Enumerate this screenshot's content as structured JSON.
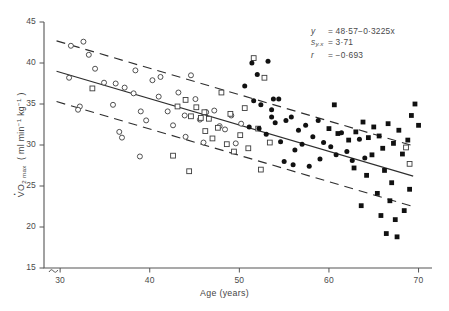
{
  "chart_data": {
    "type": "scatter",
    "title": "",
    "xlabel": "Age (years)",
    "ylabel_plain": "VO2max (ml min-1 kg-1)",
    "xlim": [
      28.2,
      71.5
    ],
    "ylim": [
      15,
      45
    ],
    "xticks": [
      30,
      40,
      50,
      60,
      70
    ],
    "yticks": [
      45,
      40,
      35,
      30,
      25,
      20,
      15
    ],
    "grid": false,
    "legend": "none",
    "axis_break": true,
    "annotations": {
      "regression_equation": "y  = 48·57−0·3225x",
      "standard_error": "sᵧ.ₓ = 3·71",
      "correlation": "r  = −0·693",
      "symbol_y": "y",
      "symbol_s": "s",
      "symbol_r": "r",
      "value_y": "= 48·57−0·3225x",
      "value_s": "= 3·71",
      "value_r": "= −0·693"
    },
    "fit": {
      "intercept": 48.57,
      "slope": -0.3225,
      "sy_x": 3.71,
      "r": -0.693
    },
    "lines": [
      {
        "name": "regression-line",
        "style": "solid",
        "x": [
          29.6,
          69.4
        ],
        "y": [
          39.0,
          26.2
        ]
      },
      {
        "name": "upper-confidence-band",
        "style": "dashed",
        "x": [
          29.6,
          69.4
        ],
        "y": [
          42.7,
          29.9
        ]
      },
      {
        "name": "lower-confidence-band",
        "style": "dashed",
        "x": [
          29.6,
          69.4
        ],
        "y": [
          35.3,
          22.5
        ]
      }
    ],
    "series": [
      {
        "name": "open-circle",
        "marker": "open-circle",
        "points": [
          [
            31.2,
            42.1
          ],
          [
            32.6,
            42.6
          ],
          [
            33.2,
            41.0
          ],
          [
            31.0,
            38.2
          ],
          [
            33.9,
            39.3
          ],
          [
            34.9,
            37.6
          ],
          [
            36.2,
            37.5
          ],
          [
            35.9,
            34.9
          ],
          [
            32.2,
            34.7
          ],
          [
            32.0,
            34.3
          ],
          [
            37.2,
            37.0
          ],
          [
            38.2,
            36.3
          ],
          [
            38.4,
            39.1
          ],
          [
            39.0,
            34.1
          ],
          [
            40.3,
            37.9
          ],
          [
            39.6,
            33.0
          ],
          [
            41.0,
            35.9
          ],
          [
            41.2,
            38.3
          ],
          [
            42.0,
            34.1
          ],
          [
            42.6,
            32.4
          ],
          [
            43.2,
            36.4
          ],
          [
            43.9,
            33.6
          ],
          [
            44.6,
            38.5
          ],
          [
            45.1,
            35.6
          ],
          [
            45.6,
            33.1
          ],
          [
            46.3,
            34.0
          ],
          [
            46.0,
            30.3
          ],
          [
            47.2,
            34.2
          ],
          [
            47.8,
            32.3
          ],
          [
            48.4,
            31.9
          ],
          [
            36.6,
            31.6
          ],
          [
            36.9,
            30.9
          ],
          [
            44.0,
            31.0
          ],
          [
            49.1,
            33.6
          ],
          [
            49.6,
            30.2
          ],
          [
            38.9,
            28.6
          ],
          [
            50.2,
            32.6
          ]
        ]
      },
      {
        "name": "open-square",
        "marker": "open-square",
        "points": [
          [
            33.6,
            36.9
          ],
          [
            43.1,
            34.7
          ],
          [
            44.0,
            35.5
          ],
          [
            44.6,
            33.5
          ],
          [
            45.2,
            34.6
          ],
          [
            45.7,
            33.3
          ],
          [
            46.1,
            34.0
          ],
          [
            46.6,
            33.2
          ],
          [
            46.2,
            31.7
          ],
          [
            47.0,
            30.8
          ],
          [
            47.6,
            32.1
          ],
          [
            48.0,
            36.4
          ],
          [
            48.6,
            30.1
          ],
          [
            49.0,
            33.8
          ],
          [
            49.4,
            29.2
          ],
          [
            50.1,
            31.2
          ],
          [
            50.6,
            34.5
          ],
          [
            51.0,
            29.6
          ],
          [
            51.6,
            40.6
          ],
          [
            52.1,
            32.0
          ],
          [
            52.4,
            27.0
          ],
          [
            42.6,
            28.7
          ],
          [
            44.4,
            26.8
          ],
          [
            52.8,
            38.2
          ],
          [
            53.4,
            30.3
          ],
          [
            68.6,
            29.7
          ],
          [
            69.0,
            27.7
          ]
        ]
      },
      {
        "name": "filled-circle",
        "marker": "filled-circle",
        "points": [
          [
            51.4,
            40.0
          ],
          [
            52.0,
            38.6
          ],
          [
            53.2,
            40.2
          ],
          [
            50.6,
            37.2
          ],
          [
            51.6,
            35.4
          ],
          [
            52.4,
            34.9
          ],
          [
            53.8,
            35.6
          ],
          [
            53.6,
            34.3
          ],
          [
            53.6,
            33.4
          ],
          [
            54.4,
            35.6
          ],
          [
            54.0,
            32.7
          ],
          [
            55.2,
            33.0
          ],
          [
            51.1,
            32.2
          ],
          [
            52.2,
            32.0
          ],
          [
            53.0,
            31.3
          ],
          [
            54.6,
            30.4
          ],
          [
            55.8,
            33.4
          ],
          [
            56.6,
            31.8
          ],
          [
            56.2,
            29.4
          ],
          [
            57.4,
            32.4
          ],
          [
            57.0,
            30.1
          ],
          [
            58.2,
            31.0
          ],
          [
            58.8,
            33.0
          ],
          [
            59.4,
            30.3
          ],
          [
            59.0,
            28.3
          ],
          [
            60.2,
            29.8
          ],
          [
            60.8,
            28.8
          ],
          [
            61.4,
            31.5
          ],
          [
            62.0,
            29.2
          ],
          [
            62.6,
            28.1
          ],
          [
            55.0,
            28.0
          ],
          [
            56.0,
            27.6
          ],
          [
            63.4,
            30.7
          ],
          [
            64.0,
            28.4
          ],
          [
            57.8,
            27.4
          ]
        ]
      },
      {
        "name": "filled-square",
        "marker": "filled-square",
        "points": [
          [
            60.0,
            32.0
          ],
          [
            61.0,
            31.4
          ],
          [
            62.2,
            30.6
          ],
          [
            63.0,
            31.6
          ],
          [
            63.8,
            32.8
          ],
          [
            64.4,
            30.9
          ],
          [
            65.0,
            32.2
          ],
          [
            64.8,
            28.8
          ],
          [
            65.6,
            31.1
          ],
          [
            66.0,
            29.6
          ],
          [
            66.6,
            32.6
          ],
          [
            67.2,
            30.2
          ],
          [
            67.8,
            31.8
          ],
          [
            68.2,
            28.9
          ],
          [
            68.8,
            30.6
          ],
          [
            69.2,
            33.6
          ],
          [
            66.2,
            26.9
          ],
          [
            67.0,
            25.4
          ],
          [
            64.2,
            26.3
          ],
          [
            65.4,
            24.1
          ],
          [
            66.8,
            23.2
          ],
          [
            63.6,
            22.6
          ],
          [
            65.8,
            21.4
          ],
          [
            67.4,
            20.9
          ],
          [
            66.4,
            19.2
          ],
          [
            67.6,
            18.8
          ],
          [
            68.4,
            22.0
          ],
          [
            69.0,
            24.6
          ],
          [
            62.8,
            27.2
          ],
          [
            69.6,
            35.0
          ],
          [
            70.0,
            32.4
          ],
          [
            60.6,
            34.9
          ]
        ]
      }
    ]
  }
}
